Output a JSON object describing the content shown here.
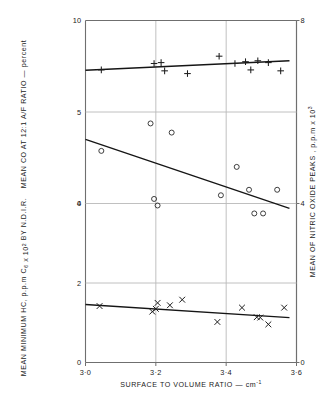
{
  "chart_data": {
    "type": "scatter",
    "title": "",
    "subtitle": "",
    "xlabel": "SURFACE TO VOLUME RATIO — cm",
    "xlabel_sup": "-1",
    "xlim": [
      3.0,
      3.6
    ],
    "xticks": [
      3.0,
      3.2,
      3.4,
      3.6
    ],
    "xticklabels": [
      "3·0",
      "3·2",
      "3·4",
      "3·6"
    ],
    "grid": true,
    "legend": "none",
    "panels": [
      {
        "name": "co-panel",
        "ylabel": "MEAN CO AT 12:1 A/F RATIO — percent",
        "ylim": [
          0,
          10
        ],
        "yticks": [
          0,
          5,
          10
        ],
        "yticklabels": [
          "0",
          "5",
          "10"
        ],
        "marker": "plus",
        "series_name": "Mean CO at 12:1 A/F ratio",
        "points": [
          {
            "x": 3.045,
            "y": 7.3
          },
          {
            "x": 3.195,
            "y": 7.65
          },
          {
            "x": 3.215,
            "y": 7.7
          },
          {
            "x": 3.225,
            "y": 7.25
          },
          {
            "x": 3.29,
            "y": 7.1
          },
          {
            "x": 3.38,
            "y": 8.05
          },
          {
            "x": 3.425,
            "y": 7.65
          },
          {
            "x": 3.455,
            "y": 7.75
          },
          {
            "x": 3.47,
            "y": 7.3
          },
          {
            "x": 3.49,
            "y": 7.8
          },
          {
            "x": 3.52,
            "y": 7.7
          },
          {
            "x": 3.555,
            "y": 7.25
          }
        ],
        "fit_line": {
          "x1": 3.0,
          "y1": 7.28,
          "x2": 3.58,
          "y2": 7.8
        }
      },
      {
        "name": "no-panel",
        "ylabel": "MEAN OF NITRIC OXIDE PEAKS , p.p.m x 10",
        "ylabel_sup": "3",
        "ylim": [
          0,
          8
        ],
        "yticks": [
          0,
          4,
          8
        ],
        "yticklabels": [
          "0",
          "4",
          "8"
        ],
        "marker": "circle",
        "series_name": "Mean of nitric oxide peaks",
        "points": [
          {
            "x": 3.045,
            "y": 5.15
          },
          {
            "x": 3.185,
            "y": 5.75
          },
          {
            "x": 3.195,
            "y": 4.1
          },
          {
            "x": 3.205,
            "y": 3.95
          },
          {
            "x": 3.245,
            "y": 5.55
          },
          {
            "x": 3.385,
            "y": 4.18
          },
          {
            "x": 3.43,
            "y": 4.8
          },
          {
            "x": 3.465,
            "y": 4.3
          },
          {
            "x": 3.48,
            "y": 3.75
          },
          {
            "x": 3.505,
            "y": 3.75
          },
          {
            "x": 3.545,
            "y": 4.3
          }
        ],
        "fit_line": {
          "x1": 3.0,
          "y1": 5.4,
          "x2": 3.58,
          "y2": 3.88
        }
      },
      {
        "name": "hc-panel",
        "ylabel": "MEAN MINIMUM HC, p.p.m C",
        "ylabel_sub": "6",
        "ylabel_mid": " x 10",
        "ylabel_sup": "2",
        "ylabel_end": " BY N.D.I.R.",
        "ylim": [
          0,
          4
        ],
        "yticks": [
          0,
          2,
          4
        ],
        "yticklabels": [
          "0",
          "2",
          "4"
        ],
        "marker": "cross",
        "series_name": "Mean minimum HC",
        "points": [
          {
            "x": 3.04,
            "y": 1.42
          },
          {
            "x": 3.19,
            "y": 1.28
          },
          {
            "x": 3.2,
            "y": 1.35
          },
          {
            "x": 3.205,
            "y": 1.5
          },
          {
            "x": 3.24,
            "y": 1.44
          },
          {
            "x": 3.275,
            "y": 1.58
          },
          {
            "x": 3.375,
            "y": 1.02
          },
          {
            "x": 3.445,
            "y": 1.38
          },
          {
            "x": 3.487,
            "y": 1.14
          },
          {
            "x": 3.497,
            "y": 1.13
          },
          {
            "x": 3.52,
            "y": 0.96
          },
          {
            "x": 3.565,
            "y": 1.38
          }
        ],
        "fit_line": {
          "x1": 3.0,
          "y1": 1.46,
          "x2": 3.58,
          "y2": 1.13
        }
      }
    ]
  }
}
